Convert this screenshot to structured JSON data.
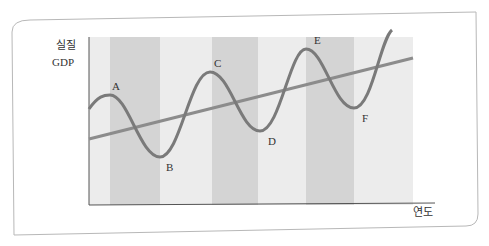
{
  "figure": {
    "y_axis_label_line1": "실질",
    "y_axis_label_line2": "GDP",
    "x_axis_label": "연도",
    "points": {
      "A": "A",
      "B": "B",
      "C": "C",
      "D": "D",
      "E": "E",
      "F": "F"
    },
    "colors": {
      "curve": "#7a7a7a",
      "trend": "#8c8c8c",
      "band_dark": "#d4d4d4",
      "band_light": "#ececec",
      "frame": "#b0b0b0"
    }
  }
}
